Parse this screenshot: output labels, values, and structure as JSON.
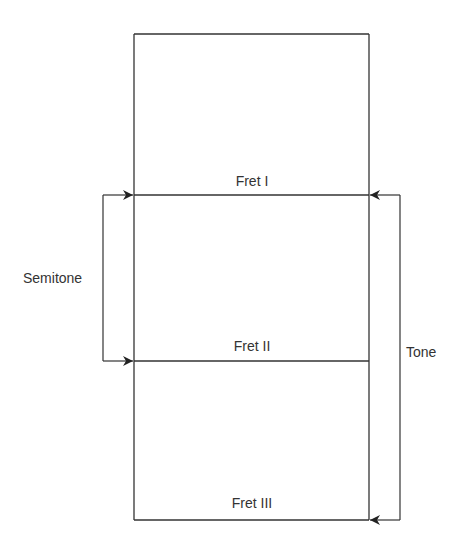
{
  "diagram": {
    "frets": [
      {
        "label": "Fret I"
      },
      {
        "label": "Fret II"
      },
      {
        "label": "Fret III"
      }
    ],
    "intervals": {
      "semitone": "Semitone",
      "tone": "Tone"
    },
    "colors": {
      "line": "#333333",
      "background": "#ffffff"
    }
  }
}
